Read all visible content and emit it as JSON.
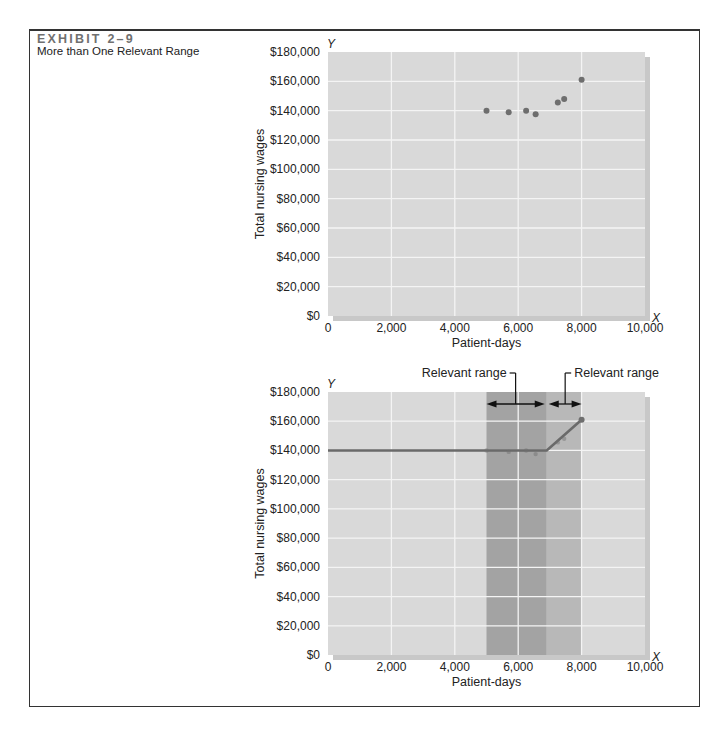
{
  "exhibit": {
    "number": "EXHIBIT 2–9",
    "title": "More than One Relevant Range"
  },
  "colors": {
    "plot_bg": "#d9d9d9",
    "grid": "#f4f4f4",
    "shadow": "#9a9a9a",
    "point": "#6e6e6e",
    "line": "#6a6a6a",
    "range_dark": "#a3a3a3",
    "range_light": "#b8b8b8"
  },
  "chart_data": [
    {
      "type": "scatter",
      "title": "",
      "xlabel": "Patient-days",
      "ylabel": "Total nursing wages",
      "x_axis_letter": "X",
      "y_axis_letter": "Y",
      "xlim": [
        0,
        10000
      ],
      "ylim": [
        0,
        180000
      ],
      "x_ticks": [
        "0",
        "2,000",
        "4,000",
        "6,000",
        "8,000",
        "10,000"
      ],
      "y_ticks": [
        "$0",
        "$20,000",
        "$40,000",
        "$60,000",
        "$80,000",
        "$100,000",
        "$120,000",
        "$140,000",
        "$160,000",
        "$180,000"
      ],
      "grid": true,
      "points": [
        {
          "x": 5000,
          "y": 140000
        },
        {
          "x": 5700,
          "y": 139000
        },
        {
          "x": 6250,
          "y": 140000
        },
        {
          "x": 6550,
          "y": 137500
        },
        {
          "x": 7250,
          "y": 145500
        },
        {
          "x": 7450,
          "y": 148000
        },
        {
          "x": 8000,
          "y": 161000
        }
      ]
    },
    {
      "type": "line",
      "title": "",
      "xlabel": "Patient-days",
      "ylabel": "Total nursing wages",
      "x_axis_letter": "X",
      "y_axis_letter": "Y",
      "xlim": [
        0,
        10000
      ],
      "ylim": [
        0,
        180000
      ],
      "x_ticks": [
        "0",
        "2,000",
        "4,000",
        "6,000",
        "8,000",
        "10,000"
      ],
      "y_ticks": [
        "$0",
        "$20,000",
        "$40,000",
        "$60,000",
        "$80,000",
        "$100,000",
        "$120,000",
        "$140,000",
        "$160,000",
        "$180,000"
      ],
      "grid": true,
      "series": [
        {
          "name": "Total nursing wages (step cost)",
          "x": [
            0,
            6900,
            8000
          ],
          "y": [
            140000,
            140000,
            161000
          ]
        }
      ],
      "points": [
        {
          "x": 5000,
          "y": 140000
        },
        {
          "x": 5700,
          "y": 139000
        },
        {
          "x": 6250,
          "y": 140000
        },
        {
          "x": 6550,
          "y": 137500
        },
        {
          "x": 7250,
          "y": 145500
        },
        {
          "x": 7450,
          "y": 148000
        },
        {
          "x": 8000,
          "y": 161000
        }
      ],
      "shaded_ranges": [
        {
          "label": "Relevant range",
          "x_start": 5000,
          "x_end": 6900,
          "shade": "dark"
        },
        {
          "label": "Relevant range",
          "x_start": 6900,
          "x_end": 8000,
          "shade": "light"
        }
      ],
      "annotations": [
        "Relevant range",
        "Relevant range"
      ]
    }
  ]
}
